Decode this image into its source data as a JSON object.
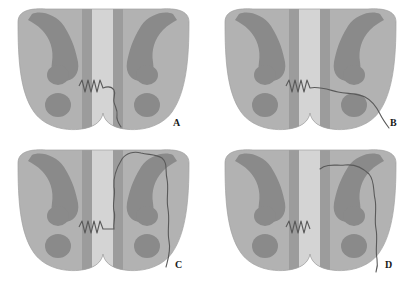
{
  "figure": {
    "background_color": "#ffffff",
    "grid": {
      "rows": 2,
      "cols": 2
    },
    "colors": {
      "body_light_gray": "#b2b2b2",
      "body_mid_gray": "#a8a8a8",
      "dark_structure": "#8a8a8a",
      "canal_pale": "#d2d2d2",
      "canal_band": "#9c9c9c",
      "line_stroke": "#555555",
      "label_color": "#1a1a1a"
    }
  },
  "panels": [
    {
      "id": "panel-a",
      "label": "A",
      "label_x": 173,
      "label_y": 122,
      "description": "Zigzag segment in central canal with short wavy line descending along right paramedian border",
      "features": {
        "zigzag": true,
        "wavy_line": "short-right-descending",
        "hooks": 2,
        "nodules_per_side": 2
      }
    },
    {
      "id": "panel-b",
      "label": "B",
      "label_x": 390,
      "label_y": 124,
      "description": "Zigzag segment in central canal with wavy line extending laterally to the right inferior margin",
      "features": {
        "zigzag": true,
        "wavy_line": "lateral-right-to-inferior-margin",
        "hooks": 2,
        "nodules_per_side": 2
      }
    },
    {
      "id": "panel-c",
      "label": "C",
      "label_x": 175,
      "label_y": 264,
      "description": "Zigzag segment with a large closed wavy loop enclosing the right hook and nodules",
      "features": {
        "zigzag": true,
        "wavy_line": "closed-loop-right-hemisection",
        "hooks": 2,
        "nodules_per_side": 2
      }
    },
    {
      "id": "panel-d",
      "label": "D",
      "label_x": 385,
      "label_y": 264,
      "description": "Zigzag segment with wavy line arcing over right hook and descending along the lateral margin",
      "features": {
        "zigzag": true,
        "wavy_line": "over-hook-lateral-descending",
        "hooks": 2,
        "nodules_per_side": 2
      }
    }
  ]
}
